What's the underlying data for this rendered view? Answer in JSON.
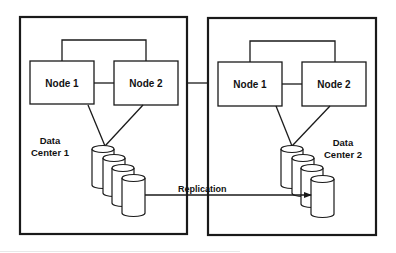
{
  "diagram": {
    "type": "replication-topology",
    "colors": {
      "stroke": "#1a1a1a",
      "background": "#ffffff",
      "text": "#111111"
    },
    "data_centers": [
      {
        "label_line1": "Data",
        "label_line2": "Center 1",
        "nodes": [
          {
            "label": "Node 1"
          },
          {
            "label": "Node 2"
          }
        ],
        "storage_disks": 4
      },
      {
        "label_line1": "Data",
        "label_line2": "Center 2",
        "nodes": [
          {
            "label": "Node 1"
          },
          {
            "label": "Node 2"
          }
        ],
        "storage_disks": 4
      }
    ],
    "replication": {
      "label": "Replication",
      "from": "Data Center 1 storage",
      "to": "Data Center 2 storage"
    },
    "inter_site_link": true
  }
}
